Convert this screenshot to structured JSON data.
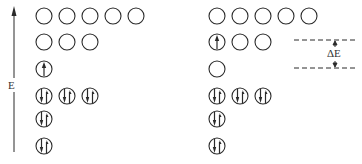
{
  "diagram": {
    "axis": {
      "label": "E",
      "direction": "up"
    },
    "delta_label": "ΔE",
    "colors": {
      "stroke": "#2a2a2a",
      "background": "#ffffff"
    },
    "panels": [
      {
        "name": "ground-state",
        "levels": [
          {
            "orbitals": [
              "empty",
              "empty",
              "empty",
              "empty",
              "empty"
            ]
          },
          {
            "orbitals": [
              "empty",
              "empty",
              "empty"
            ]
          },
          {
            "orbitals": [
              "up"
            ]
          },
          {
            "orbitals": [
              "paired",
              "paired",
              "paired"
            ]
          },
          {
            "orbitals": [
              "paired"
            ]
          },
          {
            "orbitals": [
              "paired"
            ]
          }
        ]
      },
      {
        "name": "excited-state",
        "levels": [
          {
            "orbitals": [
              "empty",
              "empty",
              "empty",
              "empty",
              "empty"
            ]
          },
          {
            "orbitals": [
              "up",
              "empty",
              "empty"
            ]
          },
          {
            "orbitals": [
              "empty"
            ]
          },
          {
            "orbitals": [
              "paired",
              "paired",
              "paired"
            ]
          },
          {
            "orbitals": [
              "paired"
            ]
          },
          {
            "orbitals": [
              "paired"
            ]
          }
        ]
      }
    ]
  }
}
